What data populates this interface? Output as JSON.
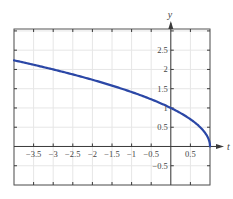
{
  "chart_data": {
    "type": "line",
    "title": "",
    "xlabel": "t",
    "ylabel": "y",
    "xlim": [
      -4.0,
      1.0
    ],
    "ylim": [
      -1.0,
      3.05
    ],
    "grid": true,
    "grid_step": 0.5,
    "x_ticks": [
      -3.5,
      -3,
      -2.5,
      -2,
      -1.5,
      -1,
      -0.5,
      0.5
    ],
    "x_tick_labels": [
      "−3.5",
      "−3",
      "−2.5",
      "−2",
      "−1.5",
      "−1",
      "−0.5",
      "0.5"
    ],
    "y_ticks": [
      -0.5,
      0.5,
      1,
      1.5,
      2,
      2.5
    ],
    "y_tick_labels": [
      "−0.5",
      "0.5",
      "1",
      "1.5",
      "2",
      "2.5"
    ],
    "series": [
      {
        "name": "y = sqrt(1 - t)",
        "color": "#2b47a6",
        "x": [
          -4,
          -3.5,
          -3,
          -2.5,
          -2,
          -1.5,
          -1,
          -0.5,
          0,
          0.25,
          0.5,
          0.75,
          0.9,
          0.97,
          1
        ],
        "y": [
          2.236,
          2.121,
          2.0,
          1.871,
          1.732,
          1.581,
          1.414,
          1.225,
          1.0,
          0.866,
          0.707,
          0.5,
          0.316,
          0.173,
          0
        ]
      }
    ]
  },
  "colors": {
    "axis": "#3a3a3a",
    "grid": "#e6e6e6",
    "frame": "#555555"
  }
}
